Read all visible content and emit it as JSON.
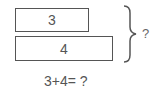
{
  "bars": [
    {
      "label": "3"
    },
    {
      "label": "4"
    }
  ],
  "brace_label": "?",
  "equation": "3+4= ?"
}
